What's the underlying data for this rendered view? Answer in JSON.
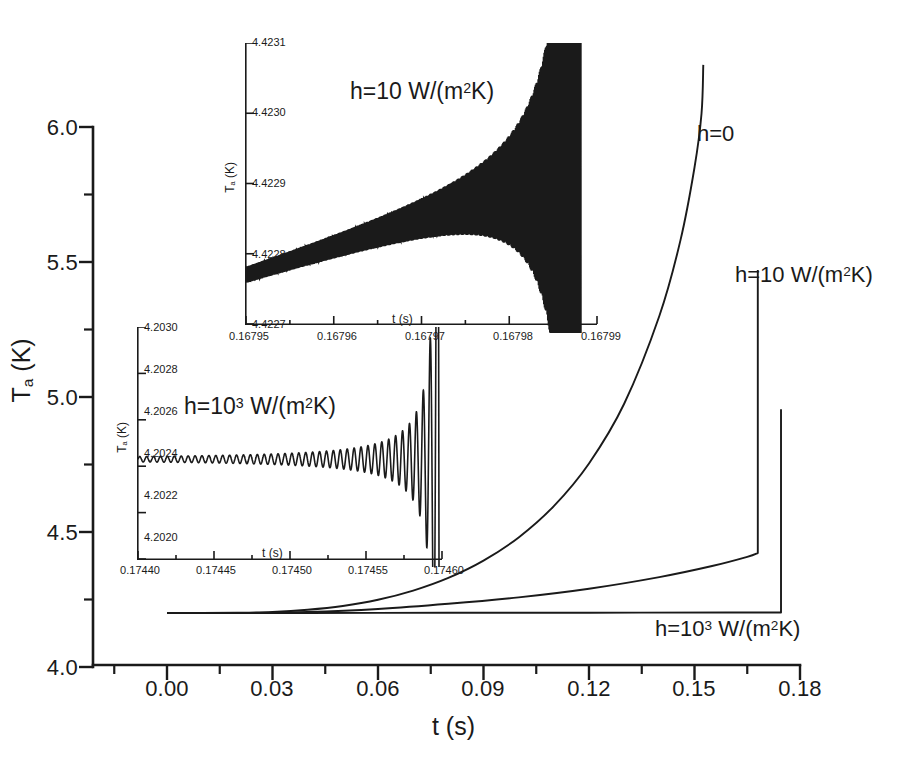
{
  "chart_data": {
    "type": "line",
    "title": "",
    "xlabel": "t (s)",
    "ylabel": "Ta (K)",
    "xlim": [
      -0.0105,
      0.1905
    ],
    "ylim": [
      4.0,
      6.0
    ],
    "x_ticks": [
      "0.00",
      "0.03",
      "0.06",
      "0.09",
      "0.12",
      "0.15",
      "0.18"
    ],
    "x_tick_values": [
      0.0,
      0.03,
      0.06,
      0.09,
      0.12,
      0.15,
      0.18
    ],
    "y_ticks": [
      "4.0",
      "4.5",
      "5.0",
      "5.5",
      "6.0"
    ],
    "y_tick_values": [
      4.0,
      4.5,
      5.0,
      5.5,
      6.0
    ],
    "y_minor_values": [
      4.25,
      4.75,
      5.25,
      5.75
    ],
    "grid": false,
    "legend": "inline-annotations",
    "series": [
      {
        "name": "h=0",
        "label": "h=0",
        "description": "Steeply diverging curve, thermal runaway near t=0.15 s",
        "points": [
          [
            0.0,
            4.2
          ],
          [
            0.01,
            4.2
          ],
          [
            0.02,
            4.201
          ],
          [
            0.03,
            4.204
          ],
          [
            0.04,
            4.212
          ],
          [
            0.05,
            4.226
          ],
          [
            0.06,
            4.249
          ],
          [
            0.07,
            4.283
          ],
          [
            0.08,
            4.33
          ],
          [
            0.09,
            4.394
          ],
          [
            0.1,
            4.48
          ],
          [
            0.11,
            4.596
          ],
          [
            0.12,
            4.754
          ],
          [
            0.13,
            4.975
          ],
          [
            0.14,
            5.3
          ],
          [
            0.146,
            5.58
          ],
          [
            0.15,
            5.85
          ],
          [
            0.152,
            6.05
          ],
          [
            0.1525,
            6.23
          ]
        ]
      },
      {
        "name": "h=10",
        "label": "h=10 W/(m2K)",
        "description": "Slow rise then vertical jump at t≈0.168 s to 5.45 K",
        "points": [
          [
            0.0,
            4.2
          ],
          [
            0.02,
            4.2
          ],
          [
            0.04,
            4.204
          ],
          [
            0.06,
            4.215
          ],
          [
            0.08,
            4.234
          ],
          [
            0.1,
            4.258
          ],
          [
            0.12,
            4.29
          ],
          [
            0.14,
            4.333
          ],
          [
            0.155,
            4.374
          ],
          [
            0.165,
            4.408
          ],
          [
            0.168,
            4.422
          ]
        ],
        "jump": {
          "t": 0.168,
          "from": 4.422,
          "to": 5.47
        }
      },
      {
        "name": "h=10^3",
        "label": "h=10^3 W/(m2K)",
        "description": "Nearly flat at 4.2 K then vertical jump at t≈0.1746 s to 4.95 K",
        "points": [
          [
            0.0,
            4.2
          ],
          [
            0.04,
            4.2
          ],
          [
            0.08,
            4.201
          ],
          [
            0.12,
            4.201
          ],
          [
            0.16,
            4.202
          ],
          [
            0.1746,
            4.202
          ]
        ],
        "jump": {
          "t": 0.1746,
          "from": 4.202,
          "to": 4.955
        }
      }
    ],
    "annotations": [
      {
        "name": "h0",
        "text": "h=0",
        "x": 0.1545,
        "y": 5.905
      },
      {
        "name": "h10",
        "text": "h=10 W/(m2K)",
        "x": 0.1585,
        "y": 5.475
      },
      {
        "name": "h1000",
        "text": "h=10^3 W/(m2K)",
        "x": 0.1445,
        "y": 4.118
      }
    ],
    "insets": [
      {
        "name": "upper-inset",
        "title": "h=10 W/(m2K)",
        "type": "line",
        "xlabel": "t (s)",
        "ylabel": "Ta (K)",
        "xlim": [
          0.16795,
          0.16799
        ],
        "ylim": [
          4.4227,
          4.4231
        ],
        "x_ticks": [
          "0.16795",
          "0.16796",
          "0.16797",
          "0.16798",
          "0.16799"
        ],
        "y_ticks": [
          "4.4227",
          "4.4228",
          "4.4229",
          "4.4230",
          "4.4231"
        ],
        "description": "Exponentially growing oscillation on a slowly rising baseline, amplitude diverging near t=0.167988"
      },
      {
        "name": "lower-inset",
        "title": "h=10^3 W/(m2K)",
        "type": "line",
        "xlabel": "t (s)",
        "ylabel": "Ta (K)",
        "xlim": [
          0.1744,
          0.1746
        ],
        "ylim": [
          4.202,
          4.203
        ],
        "x_ticks": [
          "0.17440",
          "0.17445",
          "0.17450",
          "0.17455",
          "0.17460"
        ],
        "y_ticks": [
          "4.2020",
          "4.2022",
          "4.2024",
          "4.2026",
          "4.2028",
          "4.2030"
        ],
        "description": "Exponentially growing oscillation about a flat 4.2024 K baseline, diverging near t=0.17460"
      }
    ]
  },
  "main": {
    "x_axis_title": "t (s)",
    "y_axis_title_main": "T",
    "y_axis_title_sub": "a",
    "y_axis_title_unit": " (K)",
    "x_tick_labels": [
      "0.00",
      "0.03",
      "0.06",
      "0.09",
      "0.12",
      "0.15",
      "0.18"
    ],
    "y_tick_labels": [
      "4.0",
      "4.5",
      "5.0",
      "5.5",
      "6.0"
    ]
  },
  "annotations": {
    "h0": "h=0",
    "h10_pre": "h=10 W/(m",
    "h10_sup": "2",
    "h10_post": "K)",
    "h1000_pre": "h=10",
    "h1000_sup": "3",
    "h1000_mid": " W/(m",
    "h1000_sup2": "2",
    "h1000_post": "K)"
  },
  "upper_inset": {
    "title_pre": "h=10 W/(m",
    "title_sup": "2",
    "title_post": "K)",
    "x_ticks": [
      "0.16795",
      "0.16796",
      "0.16797",
      "0.16798",
      "0.16799"
    ],
    "y_ticks": [
      "4.4227",
      "4.4228",
      "4.4229",
      "4.4230",
      "4.4231"
    ],
    "x_title": "t (s)",
    "y_title_main": "T",
    "y_title_sub": "a",
    "y_title_unit": " (K)"
  },
  "lower_inset": {
    "title_pre": "h=10",
    "title_sup": "3",
    "title_mid": " W/(m",
    "title_sup2": "2",
    "title_post": "K)",
    "x_ticks": [
      "0.17440",
      "0.17445",
      "0.17450",
      "0.17455",
      "0.17460"
    ],
    "y_ticks": [
      "4.2020",
      "4.2022",
      "4.2024",
      "4.2026",
      "4.2028",
      "4.2030"
    ],
    "x_title": "t (s)",
    "y_title_main": "T",
    "y_title_sub": "a",
    "y_title_unit": " (K)"
  }
}
